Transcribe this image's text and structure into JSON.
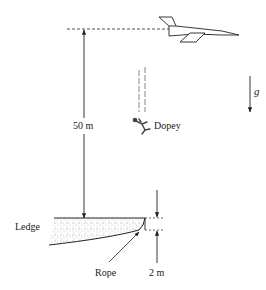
{
  "diagram": {
    "labels": {
      "height": "50 m",
      "character": "Dopey",
      "gravity": "g",
      "ledge": "Ledge",
      "rope": "Rope",
      "rope_length": "2 m"
    },
    "elements": [
      "jet-plane",
      "falling-figure",
      "ledge",
      "rope",
      "gravity-arrow",
      "height-dimension",
      "rope-dimension"
    ],
    "colors": {
      "line": "#222222",
      "background": "#ffffff"
    }
  }
}
